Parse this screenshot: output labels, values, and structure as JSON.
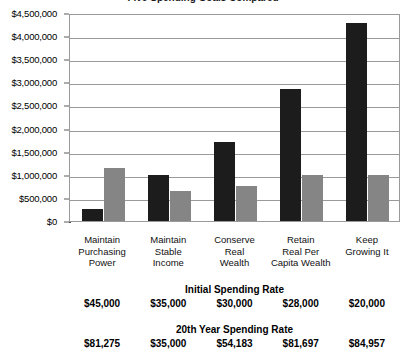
{
  "chart_data": {
    "type": "bar",
    "title": "Five Spending Goals Compared",
    "xlabel": "",
    "ylabel": "",
    "ylim": [
      0,
      4500000
    ],
    "ytick_step": 500000,
    "grid": true,
    "legend": "none",
    "categories": [
      "Maintain Purchasing Power",
      "Maintain Stable Income",
      "Conserve Real Wealth",
      "Retain Real Per Capita Wealth",
      "Keep Growing It"
    ],
    "category_lines": [
      [
        "Maintain",
        "Purchasing",
        "Power"
      ],
      [
        "Maintain",
        "Stable",
        "Income"
      ],
      [
        "Conserve",
        "Real",
        "Wealth"
      ],
      [
        "Retain",
        "Real Per",
        "Capita Wealth"
      ],
      [
        "Keep",
        "Growing It"
      ]
    ],
    "ytick_labels": [
      "$4,500,000",
      "$4,000,000",
      "$3,500,000",
      "$3,000,000",
      "$2,500,000",
      "$2,000,000",
      "$1,500,000",
      "$1,000,000",
      "$500,000",
      "$0"
    ],
    "ytick_values": [
      4500000,
      4000000,
      3500000,
      3000000,
      2500000,
      2000000,
      1500000,
      1000000,
      500000,
      0
    ],
    "series": [
      {
        "name": "series-black",
        "color": "#1c1c1c",
        "values": [
          250000,
          1000000,
          1720000,
          2850000,
          4290000
        ]
      },
      {
        "name": "series-gray",
        "color": "#858585",
        "values": [
          1150000,
          650000,
          760000,
          1000000,
          1000000
        ]
      }
    ]
  },
  "tables": [
    {
      "heading": "Initial Spending Rate",
      "values": [
        "$45,000",
        "$35,000",
        "$30,000",
        "$28,000",
        "$20,000"
      ]
    },
    {
      "heading": "20th Year Spending Rate",
      "values": [
        "$81,275",
        "$35,000",
        "$54,183",
        "$81,697",
        "$84,957"
      ]
    }
  ]
}
